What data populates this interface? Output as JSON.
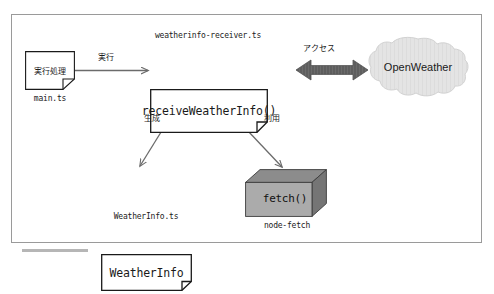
{
  "diagram": {
    "frame": {
      "border_color": "#9a9a9a",
      "background": "#ffffff"
    },
    "nodes": {
      "main": {
        "id": "main-ts",
        "shape": "document",
        "label": "実行処理",
        "caption": "main.ts"
      },
      "receiver": {
        "id": "weatherinfo-receiver",
        "shape": "document",
        "label": "receiveWeatherInfo()",
        "top_caption": "weatherinfo-receiver.ts"
      },
      "weatherinfo": {
        "id": "weatherinfo",
        "shape": "document",
        "label": "WeatherInfo",
        "caption": "WeatherInfo.ts"
      },
      "fetch": {
        "id": "node-fetch",
        "shape": "cube",
        "label": "fetch()",
        "caption": "node-fetch",
        "face_color": "#a8a8a8",
        "top_color": "#868686",
        "side_color": "#6f6f6f"
      },
      "openweather": {
        "id": "openweather",
        "shape": "cloud",
        "label": "OpenWeather",
        "fill_color": "#e2e2e2",
        "stroke_color": "#cfcfcf"
      }
    },
    "edges": [
      {
        "id": "main-to-receiver",
        "label": "実行",
        "from": "main-ts",
        "to": "weatherinfo-receiver",
        "style": "arrow"
      },
      {
        "id": "receiver-to-weatherinfo",
        "label": "生成",
        "from": "weatherinfo-receiver",
        "to": "weatherinfo",
        "style": "arrow"
      },
      {
        "id": "receiver-to-fetch",
        "label": "利用",
        "from": "weatherinfo-receiver",
        "to": "node-fetch",
        "style": "arrow"
      },
      {
        "id": "receiver-to-openweather",
        "label": "アクセス",
        "from": "weatherinfo-receiver",
        "to": "openweather",
        "style": "double-arrow",
        "color": "#5a5a5a"
      }
    ],
    "colors": {
      "line": "#6b6b6b",
      "box_stroke": "#1a1a1a",
      "text": "#1a1a1a",
      "thick_arrow": "#5a5a5a"
    }
  }
}
